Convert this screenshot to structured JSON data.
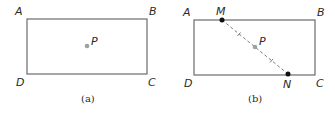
{
  "figures": [
    {
      "id": "a",
      "caption": "(a)",
      "rectangle": {
        "x": 27,
        "y": 19,
        "w": 120,
        "h": 55,
        "stroke": "#6b6b6b"
      },
      "vertices": [
        {
          "name": "A",
          "label": "A"
        },
        {
          "name": "B",
          "label": "B"
        },
        {
          "name": "C",
          "label": "C"
        },
        {
          "name": "D",
          "label": "D"
        }
      ],
      "point_p": {
        "label": "P",
        "color": "#a0a0a0"
      }
    },
    {
      "id": "b",
      "caption": "(b)",
      "rectangle": {
        "x": 194,
        "y": 20,
        "w": 121,
        "h": 55,
        "stroke": "#6b6b6b"
      },
      "vertices": [
        {
          "name": "A",
          "label": "A"
        },
        {
          "name": "B",
          "label": "B"
        },
        {
          "name": "C",
          "label": "C"
        },
        {
          "name": "D",
          "label": "D"
        }
      ],
      "point_m": {
        "label": "M",
        "color": "#111111"
      },
      "point_n": {
        "label": "N",
        "color": "#111111"
      },
      "point_p": {
        "label": "P",
        "color": "#a0a0a0"
      },
      "segment_mn": {
        "style": "dashed",
        "tick_marks": 2,
        "color": "#7a7a7a"
      }
    }
  ]
}
